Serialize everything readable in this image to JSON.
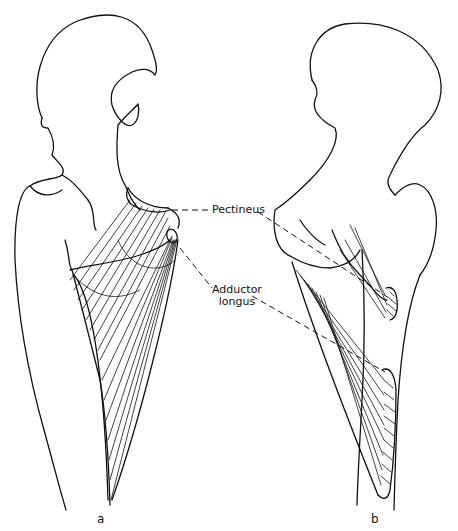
{
  "figure": {
    "labels": {
      "pectineus": "Pectineus",
      "adductor_longus_line1": "Adductor",
      "adductor_longus_line2": "longus"
    },
    "panels": {
      "a": "a",
      "b": "b"
    },
    "colors": {
      "line": "#111111",
      "background": "#ffffff"
    }
  }
}
